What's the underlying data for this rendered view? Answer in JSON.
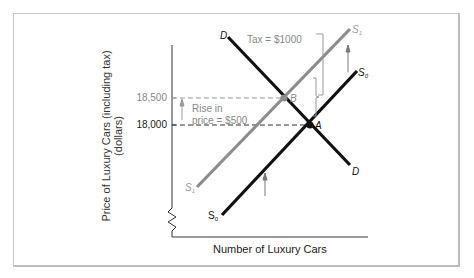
{
  "figure": {
    "y_axis_label_line1": "Price of Luxury Cars (including tax)",
    "y_axis_label_line2": "(dollars)",
    "x_axis_label": "Number of Luxury Cars",
    "y_ticks": [
      "18,500",
      "18,000"
    ],
    "curve_labels": {
      "demand_top": "D",
      "demand_bottom": "D",
      "supply0_top": "S",
      "supply0_top_sub": "0",
      "supply0_bottom": "S",
      "supply0_bottom_sub": "0",
      "supply1_top": "S",
      "supply1_top_sub": "1",
      "supply1_bottom": "S",
      "supply1_bottom_sub": "1"
    },
    "points": {
      "A": "A",
      "B": "B"
    },
    "annotations": {
      "tax": "Tax = $1000",
      "rise_line1": "Rise in",
      "rise_line2": "price = $500"
    },
    "colors": {
      "demand": "#111111",
      "supply0": "#111111",
      "supply1": "#8c8c8c",
      "annotation": "#8a8a8a"
    }
  }
}
